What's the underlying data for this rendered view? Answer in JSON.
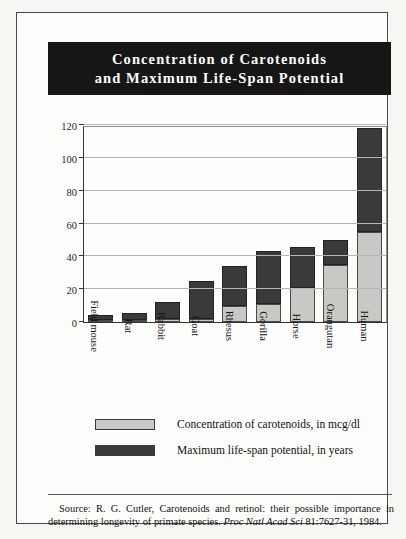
{
  "title": {
    "line1": "Concentration of Carotenoids",
    "line2": "and Maximum Life-Span Potential"
  },
  "legend": {
    "items": [
      {
        "label": "Concentration of carotenoids, in mcg/dl",
        "color": "#c8c8c4",
        "swatch_name": "legend-swatch-carotenoids"
      },
      {
        "label": "Maximum life-span potential, in years",
        "color": "#3a3a3a",
        "swatch_name": "legend-swatch-lifespan"
      }
    ]
  },
  "source": {
    "prefix": "Source: R. G. Cutler, Carotenoids and retinol: their possible importance in determining longevity of primate species. ",
    "journal": "Proc Natl Acad Sci",
    "suffix": " 81:7627-31, 1984."
  },
  "colors": {
    "banner_background": "#161616",
    "banner_text": "#ffffff",
    "carotenoids": "#c8c8c4",
    "lifespan": "#3a3a3a",
    "gridline": "#b5b5b5",
    "page_background": "#fdfdfb",
    "frame_border": "#4a4a48"
  },
  "chart_data": {
    "type": "bar",
    "title": "Concentration of Carotenoids and Maximum Life-Span Potential",
    "subtitle": "",
    "xlabel": "",
    "ylabel": "",
    "stacked": true,
    "grid": true,
    "legend_position": "bottom",
    "ylim": [
      0,
      120
    ],
    "yticks": [
      0,
      20,
      40,
      60,
      80,
      100,
      120
    ],
    "categories": [
      "Field mouse",
      "Rat",
      "Rabbit",
      "Goat",
      "Rhesus",
      "Gorilla",
      "Horse",
      "Orangutan",
      "Human"
    ],
    "series": [
      {
        "name": "Concentration of carotenoids, in mcg/dl",
        "color": "#c8c8c4",
        "values": [
          1,
          1,
          2,
          2,
          10,
          11,
          21,
          35,
          55
        ]
      },
      {
        "name": "Maximum life-span potential, in years",
        "color": "#3a3a3a",
        "values": [
          3,
          4,
          10,
          23,
          24,
          32,
          25,
          15,
          63
        ]
      }
    ],
    "totals": [
      4,
      5,
      12,
      25,
      34,
      43,
      46,
      50,
      118
    ]
  }
}
